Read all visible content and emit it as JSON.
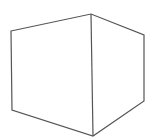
{
  "figure": {
    "type": "box-line-drawing",
    "stroke_color": "#555555",
    "background": "#ffffff",
    "stroke_width": 1.2,
    "vertices": {
      "top_left": [
        11,
        31
      ],
      "top_center": [
        91,
        14
      ],
      "top_right": [
        144,
        35
      ],
      "bottom_right": [
        144,
        101
      ],
      "bottom_center": [
        93,
        136
      ],
      "bottom_left": [
        12,
        110
      ]
    }
  }
}
